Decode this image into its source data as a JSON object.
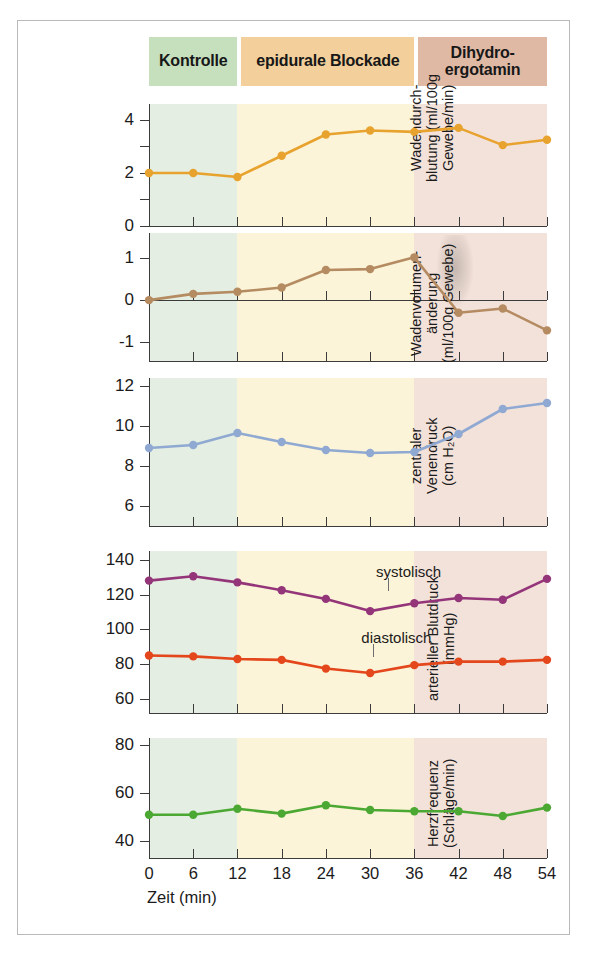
{
  "figure": {
    "phases": [
      {
        "label": "Kontrolle",
        "color": "#c6dfbd",
        "start_min": 0,
        "end_min": 12
      },
      {
        "label": "epidurale Blockade",
        "color": "#f2cf9b",
        "start_min": 12,
        "end_min": 36
      },
      {
        "label": "Dihydro-\nergotamin",
        "color": "#e0b9a4",
        "start_min": 36,
        "end_min": 54
      }
    ],
    "plot_bands": [
      {
        "color": "#e4eee2",
        "start_min": 0,
        "end_min": 12
      },
      {
        "color": "#fbf4d8",
        "start_min": 12,
        "end_min": 36
      },
      {
        "color": "#f3e2da",
        "start_min": 36,
        "end_min": 54
      }
    ],
    "x": [
      0,
      6,
      12,
      18,
      24,
      30,
      36,
      42,
      48,
      54
    ],
    "xlabel": "Zeit (min)",
    "xticklabels": [
      "0",
      "6",
      "12",
      "18",
      "24",
      "30",
      "36",
      "42",
      "48",
      "54"
    ]
  },
  "chart_data": [
    {
      "type": "line",
      "title": "",
      "ylabel": "Wadendurch-\nblutung (ml/100g\nGewebe/min)",
      "xlabel": "Zeit (min)",
      "x": [
        0,
        6,
        12,
        18,
        24,
        30,
        36,
        42,
        48,
        54
      ],
      "ylim": [
        0,
        4.6
      ],
      "yticks": [
        0,
        1,
        2,
        3,
        4
      ],
      "yticklabels": [
        "0",
        "",
        "2",
        "",
        "4"
      ],
      "grid": false,
      "series": [
        {
          "name": "Wadendurchblutung",
          "color": "#e8a22e",
          "values": [
            2.0,
            2.0,
            1.85,
            2.65,
            3.45,
            3.6,
            3.55,
            3.7,
            3.05,
            3.25
          ]
        }
      ]
    },
    {
      "type": "line",
      "title": "",
      "ylabel": "Wadenvolumen-\nänderung\n(ml/100g Gewebe)",
      "xlabel": "Zeit (min)",
      "x": [
        0,
        6,
        12,
        18,
        24,
        30,
        36,
        42,
        48,
        54
      ],
      "ylim": [
        -1.45,
        1.6
      ],
      "yticks": [
        -1,
        0,
        1
      ],
      "yticklabels": [
        "-1",
        "0",
        "1"
      ],
      "grid": false,
      "zeroline": true,
      "series": [
        {
          "name": "Wadenvolumenänderung",
          "color": "#b58b62",
          "values": [
            0.0,
            0.15,
            0.2,
            0.3,
            0.72,
            0.74,
            1.02,
            -0.3,
            -0.2,
            -0.72
          ]
        }
      ]
    },
    {
      "type": "line",
      "title": "",
      "ylabel": "zentraler\nVenendruck\n(cm H₂O)",
      "xlabel": "Zeit (min)",
      "x": [
        0,
        6,
        12,
        18,
        24,
        30,
        36,
        42,
        48,
        54
      ],
      "ylim": [
        5.0,
        12.4
      ],
      "yticks": [
        6,
        8,
        10,
        12
      ],
      "yticklabels": [
        "6",
        "8",
        "10",
        "12"
      ],
      "grid": false,
      "series": [
        {
          "name": "zentraler Venendruck",
          "color": "#8fa9d2",
          "values": [
            8.9,
            9.05,
            9.65,
            9.2,
            8.8,
            8.65,
            8.7,
            9.6,
            10.85,
            11.15
          ]
        }
      ]
    },
    {
      "type": "line",
      "title": "",
      "ylabel": "arterieller Blutdruck\n(mmHg)",
      "xlabel": "Zeit (min)",
      "x": [
        0,
        6,
        12,
        18,
        24,
        30,
        36,
        42,
        48,
        54
      ],
      "ylim": [
        52,
        145
      ],
      "yticks": [
        60,
        80,
        100,
        120,
        140
      ],
      "yticklabels": [
        "60",
        "80",
        "100",
        "120",
        "140"
      ],
      "grid": false,
      "annotations": [
        {
          "text": "systolisch",
          "x_min": 30,
          "y_value": 133
        },
        {
          "text": "diastolisch",
          "x_min": 28,
          "y_value": 95
        }
      ],
      "series": [
        {
          "name": "systolisch",
          "color": "#94357a",
          "values": [
            128,
            130.5,
            127,
            122.5,
            117.5,
            110.5,
            115,
            118,
            117,
            129
          ]
        },
        {
          "name": "diastolisch",
          "color": "#e4471b",
          "values": [
            85,
            84.5,
            83,
            82.5,
            77.5,
            75,
            79.5,
            81.5,
            81.5,
            82.5
          ]
        }
      ]
    },
    {
      "type": "line",
      "title": "",
      "ylabel": "Herzfrequenz\n(Schläge/min)",
      "xlabel": "Zeit (min)",
      "x": [
        0,
        6,
        12,
        18,
        24,
        30,
        36,
        42,
        48,
        54
      ],
      "ylim": [
        33,
        83
      ],
      "yticks": [
        40,
        60,
        80
      ],
      "yticklabels": [
        "40",
        "60",
        "80"
      ],
      "grid": false,
      "series": [
        {
          "name": "Herzfrequenz",
          "color": "#4ba832",
          "values": [
            51,
            51,
            53.5,
            51.5,
            55,
            53,
            52.5,
            52.5,
            50.5,
            54
          ]
        }
      ]
    }
  ]
}
